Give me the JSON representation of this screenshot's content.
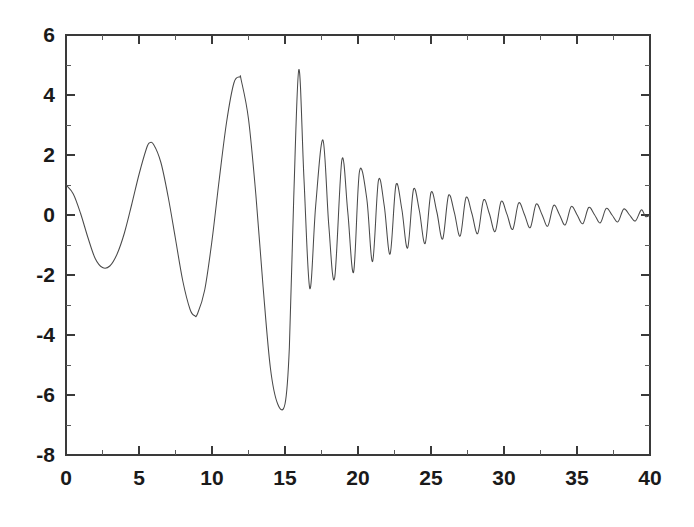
{
  "chart_data": {
    "type": "line",
    "title": "",
    "subtitle": "",
    "xlabel": "",
    "ylabel": "",
    "xlim": [
      0,
      40
    ],
    "ylim": [
      -8,
      6
    ],
    "grid": false,
    "legend": null,
    "legend_position": "none",
    "x_ticks": [
      0,
      5,
      10,
      15,
      20,
      25,
      30,
      35,
      40
    ],
    "x_tick_labels": [
      "0",
      "5",
      "10",
      "15",
      "20",
      "25",
      "30",
      "35",
      "40"
    ],
    "x_minor_tick_step": 2.5,
    "y_ticks": [
      -8,
      -6,
      -4,
      -2,
      0,
      2,
      4,
      6
    ],
    "y_tick_labels": [
      "-8",
      "-6",
      "-4",
      "-2",
      "0",
      "2",
      "4",
      "6"
    ],
    "y_minor_tick_step": 1,
    "axis_style": "box-left-bottom-top-right",
    "line_color": "#4a4a4a",
    "background_color": "#ffffff",
    "series": [
      {
        "name": "damped chirp",
        "description": "Oscillation whose amplitude decays and whose frequency increases with x; peaks at x=0 (1.0), local min -1.75 near x=2.5, peak 2.4 near x=5.7, min -3.35 near x=8.8, peak 4.6 near x=11.9, min -6.3 near x=15.0, peak 4.85 near x=16.0, then rapidly shrinking zig-zag toward 0 at x=40.",
        "x": [
          0,
          0.5,
          1,
          1.5,
          2,
          2.5,
          3,
          3.5,
          4,
          4.5,
          5,
          5.5,
          5.7,
          6,
          6.5,
          7,
          7.5,
          8,
          8.5,
          8.8,
          9,
          9.5,
          10,
          10.5,
          11,
          11.5,
          11.9,
          12,
          12.5,
          13,
          13.5,
          14,
          14.5,
          15,
          15.3,
          15.6,
          15.95,
          16.3,
          16.7,
          17.1,
          17.6,
          18,
          18.4,
          18.9,
          19.3,
          19.7,
          20.1,
          20.6,
          21,
          21.4,
          21.8,
          22.2,
          22.6,
          23,
          23.4,
          23.8,
          24.2,
          24.6,
          25,
          25.4,
          25.8,
          26.2,
          26.6,
          27,
          27.4,
          27.8,
          28.2,
          28.6,
          29,
          29.4,
          29.8,
          30.2,
          30.6,
          31,
          31.4,
          31.8,
          32.2,
          32.6,
          33,
          33.4,
          33.8,
          34.2,
          34.6,
          35,
          35.4,
          35.8,
          36.2,
          36.6,
          37,
          37.4,
          37.8,
          38.2,
          38.6,
          39,
          39.4,
          39.7,
          40
        ],
        "y": [
          1.0,
          0.7,
          0.05,
          -0.75,
          -1.45,
          -1.75,
          -1.7,
          -1.3,
          -0.6,
          0.35,
          1.35,
          2.2,
          2.4,
          2.35,
          1.75,
          0.6,
          -0.8,
          -2.2,
          -3.15,
          -3.35,
          -3.3,
          -2.5,
          -0.85,
          1.2,
          3.1,
          4.4,
          4.6,
          4.5,
          3.2,
          0.7,
          -2.4,
          -5.1,
          -6.3,
          -6.3,
          -4.4,
          0.6,
          4.85,
          1.2,
          -2.45,
          0.3,
          2.5,
          -0.35,
          -2.1,
          1.85,
          0.1,
          -1.9,
          1.45,
          0.55,
          -1.55,
          1.15,
          0.3,
          -1.3,
          1.0,
          0.2,
          -1.1,
          0.85,
          0.15,
          -0.95,
          0.75,
          0.1,
          -0.8,
          0.65,
          0.08,
          -0.7,
          0.58,
          0.05,
          -0.62,
          0.5,
          0.04,
          -0.55,
          0.45,
          0.03,
          -0.48,
          0.4,
          0.02,
          -0.42,
          0.36,
          0.02,
          -0.37,
          0.32,
          0.01,
          -0.33,
          0.28,
          0.01,
          -0.29,
          0.25,
          0.01,
          -0.26,
          0.22,
          0.0,
          -0.23,
          0.2,
          0.0,
          -0.2,
          0.17,
          -0.05,
          0.0
        ]
      }
    ]
  }
}
